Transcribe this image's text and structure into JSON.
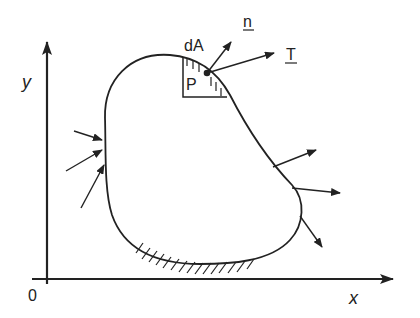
{
  "diagram": {
    "axes": {
      "x_label": "x",
      "y_label": "y",
      "origin_label": "0"
    },
    "labels": {
      "area_element": "dA",
      "point": "P",
      "normal_vector": "n",
      "traction_vector": "T"
    },
    "colors": {
      "stroke": "#222222",
      "background": "#ffffff"
    }
  }
}
